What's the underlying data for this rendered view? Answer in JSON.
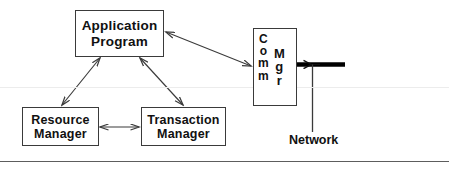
{
  "diagram": {
    "background_color": "#ffffff",
    "stroke_color": "#3a3a3a",
    "text_color": "#111111",
    "nodes": [
      {
        "id": "application-program",
        "lines": [
          "Application",
          "Program"
        ]
      },
      {
        "id": "resource-manager",
        "lines": [
          "Resource",
          "Manager"
        ]
      },
      {
        "id": "transaction-manager",
        "lines": [
          "Transaction",
          "Manager"
        ]
      },
      {
        "id": "comm-mgr",
        "orientation": "vertical",
        "columns": [
          {
            "word": "Comm",
            "chars": [
              "C",
              "o",
              "m",
              "m"
            ]
          },
          {
            "word": "Mgr",
            "chars": [
              "M",
              "g",
              "r"
            ]
          }
        ]
      }
    ],
    "connectors": [
      {
        "id": "app-to-resource",
        "from": "application-program",
        "to": "resource-manager",
        "arrows": "double"
      },
      {
        "id": "app-to-transaction",
        "from": "application-program",
        "to": "transaction-manager",
        "arrows": "double"
      },
      {
        "id": "resource-to-transaction",
        "from": "resource-manager",
        "to": "transaction-manager",
        "arrows": "double"
      },
      {
        "id": "app-to-comm",
        "from": "application-program",
        "to": "comm-mgr",
        "arrows": "double"
      },
      {
        "id": "comm-to-network",
        "from": "comm-mgr",
        "to": "network-bus",
        "arrows": "single"
      }
    ],
    "network": {
      "label": "Network",
      "bus_color": "#000000"
    },
    "rules": {
      "faint_divider_color": "#ececec",
      "bottom_divider_color": "#5d5d5d"
    }
  }
}
